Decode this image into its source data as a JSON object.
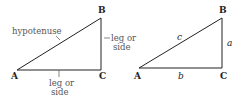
{
  "figure": {
    "left_triangle": {
      "vertices": {
        "A": "A",
        "B": "B",
        "C": "C"
      },
      "labels": {
        "hypotenuse": "hypotenuse",
        "vertical_leg_line1": "leg or",
        "vertical_leg_line2": "side",
        "horizontal_leg_line1": "leg or",
        "horizontal_leg_line2": "side"
      }
    },
    "right_triangle": {
      "vertices": {
        "A": "A",
        "B": "B",
        "C": "C"
      },
      "sides": {
        "a": "a",
        "b": "b",
        "c": "c"
      }
    },
    "colors": {
      "stroke": "#222222",
      "note_text": "#555555",
      "background": "#ffffff"
    }
  }
}
